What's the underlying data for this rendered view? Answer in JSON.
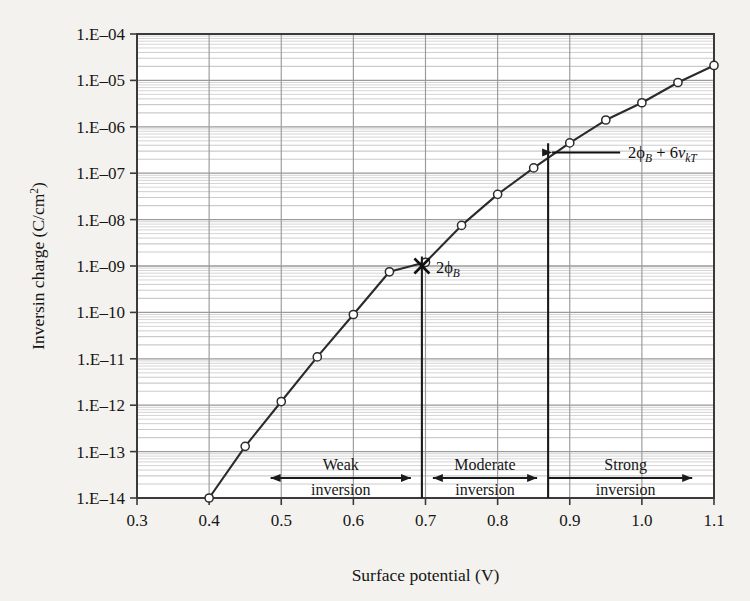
{
  "figure": {
    "background_color": "#f4f2ee",
    "plot_background_color": "#ffffff",
    "axis_color": "#3a3a3a",
    "grid_major_color": "#9a9a9a",
    "grid_minor_color": "#c9c9c9",
    "series_color": "#2b2b2b"
  },
  "chart_data": {
    "type": "line",
    "title": "",
    "subtitle": "",
    "xlabel": "Surface potential (V)",
    "ylabel": "Inversin charge (C/cm²)",
    "xlim": [
      0.3,
      1.1
    ],
    "ylim": [
      1e-14,
      0.0001
    ],
    "yscale": "log",
    "xscale": "linear",
    "grid": true,
    "grid_minor": true,
    "legend": false,
    "legend_position": "none",
    "xticks": [
      0.3,
      0.4,
      0.5,
      0.6,
      0.7,
      0.8,
      0.9,
      1.0,
      1.1
    ],
    "xtick_labels": [
      "0.3",
      "0.4",
      "0.5",
      "0.6",
      "0.7",
      "0.8",
      "0.9",
      "1.0",
      "1.1"
    ],
    "yticks": [
      1e-14,
      1e-13,
      1e-12,
      1e-11,
      1e-10,
      1e-09,
      1e-08,
      1e-07,
      1e-06,
      1e-05,
      0.0001
    ],
    "ytick_labels": [
      "1.E–14",
      "1.E–13",
      "1.E–12",
      "1.E–11",
      "1.E–10",
      "1.E–09",
      "1.E–08",
      "1.E–07",
      "1.E–06",
      "1.E–05",
      "1.E–04"
    ],
    "series": [
      {
        "name": "Inversion charge",
        "marker": "open-circle",
        "x": [
          0.4,
          0.45,
          0.5,
          0.55,
          0.6,
          0.65,
          0.7,
          0.75,
          0.8,
          0.85,
          0.9,
          0.95,
          1.0,
          1.05,
          1.1
        ],
        "y": [
          1e-14,
          1.3e-13,
          1.2e-12,
          1.1e-11,
          9e-11,
          7.5e-10,
          1.2e-09,
          7.5e-09,
          3.5e-08,
          1.3e-07,
          4.5e-07,
          1.4e-06,
          3.3e-06,
          9e-06,
          2.1e-05
        ]
      }
    ],
    "annotations": [
      {
        "id": "phi-b-marker",
        "kind": "x-marker-with-label",
        "label": "2ϕB",
        "label_parts": {
          "prefix": "2",
          "phi": "ϕ",
          "sub": "B"
        },
        "x": 0.695,
        "y": 1e-09
      },
      {
        "id": "phi-b-6vkt",
        "kind": "arrow-label",
        "label": "2ϕB + 6νkT",
        "label_parts": {
          "prefix": "2",
          "phi": "ϕ",
          "sub1": "B",
          "plus": " + 6",
          "nu": "ν",
          "sub2": "kT"
        },
        "x": 0.87,
        "y": 2.8e-07
      },
      {
        "id": "vline-weak-moderate",
        "kind": "vertical-line",
        "x": 0.695
      },
      {
        "id": "vline-moderate-strong",
        "kind": "vertical-line",
        "x": 0.87
      }
    ],
    "regions": [
      {
        "id": "weak-inversion",
        "line1": "Weak",
        "line2": "inversion",
        "x_start": 0.47,
        "x_end": 0.695,
        "arrow": "double"
      },
      {
        "id": "moderate-inversion",
        "line1": "Moderate",
        "line2": "inversion",
        "x_start": 0.695,
        "x_end": 0.87,
        "arrow": "double"
      },
      {
        "id": "strong-inversion",
        "line1": "Strong",
        "line2": "inversion",
        "x_start": 0.87,
        "x_end": 1.085,
        "arrow": "single-right"
      }
    ]
  }
}
